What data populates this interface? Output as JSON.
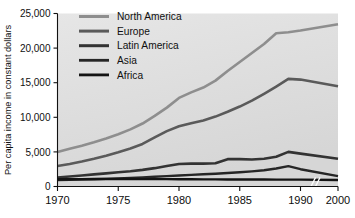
{
  "chart_data": {
    "type": "line",
    "title": "",
    "xlabel": "",
    "ylabel": "Per capita income in constant dollars",
    "xlim": [
      1970,
      2000
    ],
    "ylim": [
      0,
      25000
    ],
    "grid": false,
    "legend_position": "top-left-inside",
    "axis_break": {
      "present": true,
      "between": [
        1990,
        2000
      ],
      "marker": "//"
    },
    "x": [
      1970,
      1971,
      1972,
      1973,
      1974,
      1975,
      1976,
      1977,
      1978,
      1979,
      1980,
      1981,
      1982,
      1983,
      1984,
      1985,
      1986,
      1987,
      1988,
      1989,
      1990,
      2000
    ],
    "xticks": [
      1970,
      1975,
      1980,
      1985,
      1990,
      2000
    ],
    "xticklabels": [
      "1970",
      "1975",
      "1980",
      "1985",
      "1990",
      "2000"
    ],
    "yticks": [
      0,
      5000,
      10000,
      15000,
      20000,
      25000
    ],
    "yticklabels": [
      "0",
      "5,000",
      "10,000",
      "15,000",
      "20,000",
      "25,000"
    ],
    "series": [
      {
        "name": "North America",
        "color": "#8e8e8e",
        "values": [
          5000,
          5450,
          5900,
          6400,
          6950,
          7550,
          8250,
          9100,
          10200,
          11400,
          12800,
          13600,
          14300,
          15300,
          16700,
          18000,
          19300,
          20600,
          22150,
          22300,
          22550,
          23450
        ]
      },
      {
        "name": "Europe",
        "color": "#5a5a5a",
        "values": [
          2950,
          3250,
          3600,
          4000,
          4450,
          4950,
          5500,
          6150,
          7100,
          8000,
          8700,
          9150,
          9550,
          10100,
          10800,
          11550,
          12400,
          13400,
          14450,
          15550,
          15450,
          14500
        ]
      },
      {
        "name": "Latin America",
        "color": "#333333",
        "values": [
          1300,
          1450,
          1600,
          1750,
          1900,
          2050,
          2200,
          2400,
          2650,
          2950,
          3250,
          3300,
          3300,
          3350,
          3950,
          3950,
          3900,
          4000,
          4300,
          5000,
          4750,
          4000
        ]
      },
      {
        "name": "Asia",
        "color": "#262626",
        "values": [
          950,
          980,
          1010,
          1050,
          1100,
          1150,
          1220,
          1300,
          1400,
          1500,
          1600,
          1680,
          1760,
          1850,
          1950,
          2050,
          2180,
          2350,
          2600,
          2950,
          2500,
          1500
        ]
      },
      {
        "name": "Africa",
        "color": "#141414",
        "values": [
          1050,
          1060,
          1070,
          1075,
          1080,
          1080,
          1075,
          1070,
          1065,
          1060,
          1055,
          1045,
          1035,
          1025,
          1020,
          1015,
          1010,
          1005,
          1000,
          1000,
          990,
          950
        ]
      }
    ]
  },
  "legend": {
    "items": [
      {
        "label": "North America"
      },
      {
        "label": "Europe"
      },
      {
        "label": "Latin America"
      },
      {
        "label": "Asia"
      },
      {
        "label": "Africa"
      }
    ]
  }
}
